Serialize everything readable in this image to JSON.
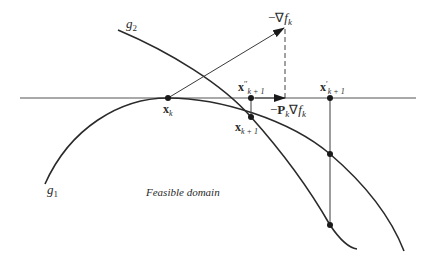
{
  "diagram": {
    "labels": {
      "g1": {
        "main": "g",
        "sub": "1"
      },
      "g2": {
        "main": "g",
        "sub": "2"
      },
      "neg_grad": {
        "prefix": "−∇",
        "main": "f",
        "sub": "k"
      },
      "proj_grad": {
        "prefix": "−",
        "bold": "P",
        "bold_sub": "k",
        "mid": "∇",
        "main": "f",
        "sub": "k"
      },
      "x_k": {
        "bold": "x",
        "sub": "k"
      },
      "x_k1": {
        "bold": "x",
        "sub": "k + 1"
      },
      "x_dd_k1": {
        "bold": "x",
        "prime": "′′",
        "sub": "k + 1"
      },
      "x_d_k1": {
        "bold": "x",
        "prime": "′",
        "sub": "k + 1"
      },
      "region": "Feasible domain"
    },
    "elements": [
      "constraint-curve-g1",
      "constraint-curve-g2",
      "tangent-line",
      "negative-gradient-arrow",
      "projected-gradient-arrow",
      "dashed-projection-line",
      "correction-line-x-double-prime",
      "correction-line-x-prime"
    ]
  }
}
